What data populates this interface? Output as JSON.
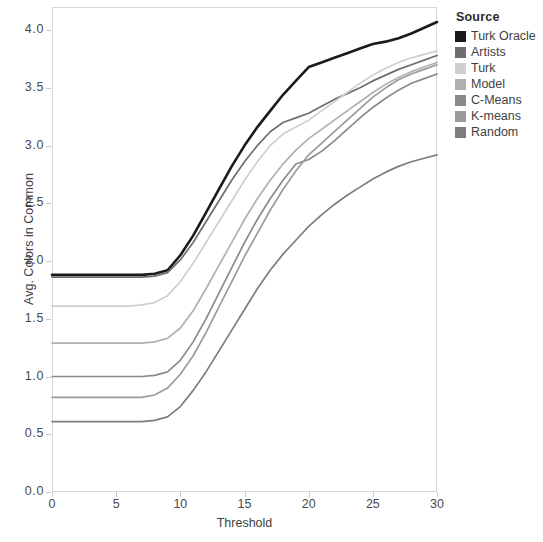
{
  "chart_data": {
    "type": "line",
    "title": "",
    "xlabel": "Threshold",
    "ylabel": "Avg. Colors in Common",
    "xlim": [
      0,
      30
    ],
    "ylim": [
      0.0,
      4.2
    ],
    "xticks": [
      "0",
      "5",
      "10",
      "15",
      "20",
      "25",
      "30"
    ],
    "xtick_values": [
      0,
      5,
      10,
      15,
      20,
      25,
      30
    ],
    "yticks": [
      "0.0",
      "0.5",
      "1.0",
      "1.5",
      "2.0",
      "2.5",
      "3.0",
      "3.5",
      "4.0"
    ],
    "ytick_values": [
      0.0,
      0.5,
      1.0,
      1.5,
      2.0,
      2.5,
      3.0,
      3.5,
      4.0
    ],
    "grid": false,
    "legend_title": "Source",
    "legend_position": "right",
    "x": [
      0,
      1,
      2,
      3,
      4,
      5,
      6,
      7,
      8,
      9,
      10,
      11,
      12,
      13,
      14,
      15,
      16,
      17,
      18,
      19,
      20,
      21,
      22,
      23,
      24,
      25,
      26,
      27,
      28,
      29,
      30
    ],
    "series": [
      {
        "name": "Turk Oracle",
        "color": "#1a1a1a",
        "values": [
          1.88,
          1.88,
          1.88,
          1.88,
          1.88,
          1.88,
          1.88,
          1.88,
          1.89,
          1.92,
          2.05,
          2.22,
          2.42,
          2.62,
          2.82,
          3.0,
          3.16,
          3.3,
          3.44,
          3.56,
          3.68,
          3.72,
          3.76,
          3.8,
          3.84,
          3.88,
          3.9,
          3.93,
          3.97,
          4.02,
          4.07
        ]
      },
      {
        "name": "Artists",
        "color": "#6e6e6e",
        "values": [
          1.86,
          1.86,
          1.86,
          1.86,
          1.86,
          1.86,
          1.86,
          1.86,
          1.87,
          1.9,
          2.01,
          2.16,
          2.34,
          2.52,
          2.7,
          2.86,
          3.0,
          3.12,
          3.2,
          3.24,
          3.28,
          3.34,
          3.4,
          3.45,
          3.5,
          3.56,
          3.61,
          3.66,
          3.7,
          3.74,
          3.78
        ]
      },
      {
        "name": "Turk",
        "color": "#cfcfcf",
        "values": [
          1.61,
          1.61,
          1.61,
          1.61,
          1.61,
          1.61,
          1.61,
          1.62,
          1.64,
          1.7,
          1.82,
          1.98,
          2.16,
          2.34,
          2.52,
          2.7,
          2.86,
          3.0,
          3.1,
          3.16,
          3.22,
          3.3,
          3.38,
          3.46,
          3.54,
          3.61,
          3.67,
          3.72,
          3.76,
          3.79,
          3.82
        ]
      },
      {
        "name": "Model",
        "color": "#b0b0b0",
        "values": [
          1.29,
          1.29,
          1.29,
          1.29,
          1.29,
          1.29,
          1.29,
          1.29,
          1.3,
          1.33,
          1.42,
          1.57,
          1.76,
          1.96,
          2.16,
          2.36,
          2.54,
          2.7,
          2.84,
          2.96,
          3.06,
          3.14,
          3.22,
          3.3,
          3.38,
          3.46,
          3.53,
          3.59,
          3.64,
          3.68,
          3.72
        ]
      },
      {
        "name": "C-Means",
        "color": "#8a8a8a",
        "values": [
          1.0,
          1.0,
          1.0,
          1.0,
          1.0,
          1.0,
          1.0,
          1.0,
          1.01,
          1.04,
          1.14,
          1.3,
          1.5,
          1.72,
          1.94,
          2.16,
          2.36,
          2.54,
          2.7,
          2.84,
          2.88,
          2.95,
          3.04,
          3.14,
          3.24,
          3.33,
          3.41,
          3.48,
          3.54,
          3.58,
          3.62
        ]
      },
      {
        "name": "K-means",
        "color": "#9b9b9b",
        "values": [
          0.82,
          0.82,
          0.82,
          0.82,
          0.82,
          0.82,
          0.82,
          0.82,
          0.84,
          0.9,
          1.02,
          1.18,
          1.38,
          1.6,
          1.82,
          2.04,
          2.24,
          2.44,
          2.62,
          2.78,
          2.92,
          3.02,
          3.12,
          3.22,
          3.32,
          3.42,
          3.5,
          3.57,
          3.62,
          3.66,
          3.7
        ]
      },
      {
        "name": "Random",
        "color": "#7d7d7d",
        "values": [
          0.61,
          0.61,
          0.61,
          0.61,
          0.61,
          0.61,
          0.61,
          0.61,
          0.62,
          0.65,
          0.74,
          0.88,
          1.04,
          1.22,
          1.4,
          1.58,
          1.76,
          1.92,
          2.06,
          2.18,
          2.3,
          2.4,
          2.49,
          2.57,
          2.64,
          2.71,
          2.77,
          2.82,
          2.86,
          2.89,
          2.92
        ]
      }
    ]
  },
  "legend": {
    "title": "Source",
    "items": [
      {
        "label": "Turk Oracle",
        "color": "#1a1a1a"
      },
      {
        "label": "Artists",
        "color": "#6e6e6e"
      },
      {
        "label": "Turk",
        "color": "#cfcfcf"
      },
      {
        "label": "Model",
        "color": "#b0b0b0"
      },
      {
        "label": "C-Means",
        "color": "#8a8a8a"
      },
      {
        "label": "K-means",
        "color": "#9b9b9b"
      },
      {
        "label": "Random",
        "color": "#7d7d7d"
      }
    ]
  },
  "axes": {
    "x_title": "Threshold",
    "y_title": "Avg. Colors in Common"
  }
}
